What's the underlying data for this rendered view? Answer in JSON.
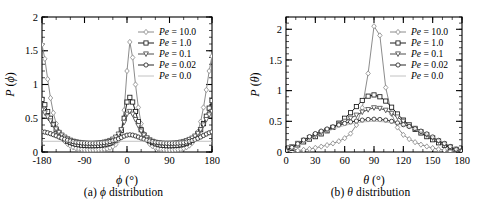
{
  "figure": {
    "panels": [
      {
        "id": "a",
        "caption_prefix": "(a)",
        "caption_symbol": "ϕ",
        "caption_text": "distribution",
        "axis_label_x_symbol": "ϕ",
        "axis_label_x_unit": "(°)",
        "axis_label_y": "P (ϕ)"
      },
      {
        "id": "b",
        "caption_prefix": "(b)",
        "caption_symbol": "θ",
        "caption_text": "distribution",
        "axis_label_x_symbol": "θ",
        "axis_label_x_unit": "(°)",
        "axis_label_y": "P (θ)"
      }
    ]
  },
  "chart_data": [
    {
      "type": "line",
      "panel": "a",
      "title": "(a) ϕ distribution",
      "xlabel": "ϕ (°)",
      "ylabel": "P (ϕ)",
      "xlim": [
        -180,
        180
      ],
      "ylim": [
        0,
        2
      ],
      "xticks": [
        -180,
        -90,
        0,
        90,
        180
      ],
      "xtick_labels": [
        "-180",
        "-90",
        "0",
        "90",
        "180"
      ],
      "yticks": [
        0,
        0.5,
        1,
        1.5,
        2
      ],
      "ytick_labels": [
        "0",
        "0.5",
        "1",
        "1.5",
        "2"
      ],
      "xminor_step": 30,
      "yminor_step": 0.1,
      "grid": false,
      "legend_position": "upper-right",
      "series": [
        {
          "name": "Pe = 10.0",
          "marker": "diamond",
          "color": "#8c8c8c",
          "x": [
            -180,
            -174,
            -168,
            -162,
            -156,
            -150,
            -144,
            -138,
            -132,
            -126,
            -120,
            -114,
            -108,
            -102,
            -96,
            -90,
            -84,
            -78,
            -72,
            -66,
            -60,
            -54,
            -48,
            -42,
            -36,
            -30,
            -24,
            -18,
            -12,
            -6,
            0,
            6,
            12,
            18,
            24,
            30,
            36,
            42,
            48,
            54,
            60,
            66,
            72,
            78,
            84,
            90,
            96,
            102,
            108,
            114,
            120,
            126,
            132,
            138,
            144,
            150,
            156,
            162,
            168,
            174,
            180
          ],
          "y": [
            1.59,
            1.38,
            1.08,
            0.8,
            0.58,
            0.42,
            0.3,
            0.22,
            0.16,
            0.12,
            0.09,
            0.07,
            0.055,
            0.045,
            0.04,
            0.035,
            0.033,
            0.032,
            0.032,
            0.033,
            0.035,
            0.038,
            0.042,
            0.05,
            0.062,
            0.08,
            0.11,
            0.17,
            0.3,
            0.62,
            1.2,
            1.63,
            1.4,
            1.0,
            0.66,
            0.42,
            0.27,
            0.18,
            0.12,
            0.085,
            0.062,
            0.05,
            0.042,
            0.036,
            0.033,
            0.032,
            0.032,
            0.033,
            0.036,
            0.042,
            0.052,
            0.07,
            0.095,
            0.135,
            0.2,
            0.3,
            0.45,
            0.66,
            0.92,
            1.2,
            1.42
          ]
        },
        {
          "name": "Pe = 1.0",
          "marker": "square",
          "color": "#1a1a1a",
          "x": [
            -180,
            -174,
            -168,
            -162,
            -156,
            -150,
            -144,
            -138,
            -132,
            -126,
            -120,
            -114,
            -108,
            -102,
            -96,
            -90,
            -84,
            -78,
            -72,
            -66,
            -60,
            -54,
            -48,
            -42,
            -36,
            -30,
            -24,
            -18,
            -12,
            -6,
            0,
            6,
            12,
            18,
            24,
            30,
            36,
            42,
            48,
            54,
            60,
            66,
            72,
            78,
            84,
            90,
            96,
            102,
            108,
            114,
            120,
            126,
            132,
            138,
            144,
            150,
            156,
            162,
            168,
            174,
            180
          ],
          "y": [
            0.78,
            0.7,
            0.6,
            0.5,
            0.41,
            0.33,
            0.27,
            0.22,
            0.185,
            0.16,
            0.14,
            0.125,
            0.115,
            0.108,
            0.102,
            0.098,
            0.095,
            0.094,
            0.094,
            0.095,
            0.098,
            0.102,
            0.108,
            0.118,
            0.13,
            0.15,
            0.18,
            0.23,
            0.32,
            0.5,
            0.74,
            0.81,
            0.74,
            0.6,
            0.45,
            0.33,
            0.25,
            0.2,
            0.165,
            0.14,
            0.122,
            0.11,
            0.102,
            0.097,
            0.094,
            0.093,
            0.094,
            0.096,
            0.1,
            0.107,
            0.117,
            0.13,
            0.15,
            0.175,
            0.21,
            0.26,
            0.33,
            0.42,
            0.53,
            0.65,
            0.76
          ]
        },
        {
          "name": "Pe = 0.1",
          "marker": "triangle-down",
          "color": "#4d4d4d",
          "x": [
            -180,
            -174,
            -168,
            -162,
            -156,
            -150,
            -144,
            -138,
            -132,
            -126,
            -120,
            -114,
            -108,
            -102,
            -96,
            -90,
            -84,
            -78,
            -72,
            -66,
            -60,
            -54,
            -48,
            -42,
            -36,
            -30,
            -24,
            -18,
            -12,
            -6,
            0,
            6,
            12,
            18,
            24,
            30,
            36,
            42,
            48,
            54,
            60,
            66,
            72,
            78,
            84,
            90,
            96,
            102,
            108,
            114,
            120,
            126,
            132,
            138,
            144,
            150,
            156,
            162,
            168,
            174,
            180
          ],
          "y": [
            0.62,
            0.58,
            0.52,
            0.46,
            0.4,
            0.34,
            0.29,
            0.25,
            0.22,
            0.195,
            0.175,
            0.16,
            0.15,
            0.142,
            0.136,
            0.132,
            0.13,
            0.129,
            0.129,
            0.131,
            0.134,
            0.139,
            0.146,
            0.156,
            0.17,
            0.19,
            0.22,
            0.265,
            0.33,
            0.44,
            0.56,
            0.6,
            0.56,
            0.48,
            0.39,
            0.31,
            0.25,
            0.21,
            0.18,
            0.158,
            0.144,
            0.135,
            0.13,
            0.128,
            0.128,
            0.129,
            0.131,
            0.134,
            0.139,
            0.146,
            0.155,
            0.168,
            0.185,
            0.205,
            0.235,
            0.275,
            0.33,
            0.4,
            0.48,
            0.55,
            0.6
          ]
        },
        {
          "name": "Pe = 0.02",
          "marker": "circle",
          "color": "#262626",
          "x": [
            -180,
            -174,
            -168,
            -162,
            -156,
            -150,
            -144,
            -138,
            -132,
            -126,
            -120,
            -114,
            -108,
            -102,
            -96,
            -90,
            -84,
            -78,
            -72,
            -66,
            -60,
            -54,
            -48,
            -42,
            -36,
            -30,
            -24,
            -18,
            -12,
            -6,
            0,
            6,
            12,
            18,
            24,
            30,
            36,
            42,
            48,
            54,
            60,
            66,
            72,
            78,
            84,
            90,
            96,
            102,
            108,
            114,
            120,
            126,
            132,
            138,
            144,
            150,
            156,
            162,
            168,
            174,
            180
          ],
          "y": [
            0.3,
            0.295,
            0.285,
            0.272,
            0.256,
            0.24,
            0.222,
            0.205,
            0.19,
            0.176,
            0.164,
            0.154,
            0.146,
            0.14,
            0.135,
            0.131,
            0.129,
            0.128,
            0.128,
            0.129,
            0.131,
            0.135,
            0.14,
            0.147,
            0.156,
            0.167,
            0.18,
            0.196,
            0.215,
            0.235,
            0.25,
            0.255,
            0.25,
            0.238,
            0.222,
            0.205,
            0.19,
            0.176,
            0.164,
            0.154,
            0.146,
            0.14,
            0.135,
            0.131,
            0.129,
            0.128,
            0.128,
            0.129,
            0.131,
            0.135,
            0.14,
            0.148,
            0.158,
            0.17,
            0.185,
            0.202,
            0.222,
            0.245,
            0.266,
            0.285,
            0.298
          ]
        },
        {
          "name": "Pe = 0.0",
          "marker": "none",
          "color": "#b3b3b3",
          "x": [
            -180,
            180
          ],
          "y": [
            0.159,
            0.159
          ]
        }
      ]
    },
    {
      "type": "line",
      "panel": "b",
      "title": "(b) θ distribution",
      "xlabel": "θ (°)",
      "ylabel": "P (θ)",
      "xlim": [
        0,
        180
      ],
      "ylim": [
        0,
        2.2
      ],
      "xticks": [
        0,
        30,
        60,
        90,
        120,
        150,
        180
      ],
      "xtick_labels": [
        "0",
        "30",
        "60",
        "90",
        "120",
        "150",
        "180"
      ],
      "yticks": [
        0,
        0.5,
        1,
        1.5,
        2
      ],
      "ytick_labels": [
        "0",
        "0.5",
        "1",
        "1.5",
        "2"
      ],
      "xminor_step": 10,
      "yminor_step": 0.1,
      "grid": false,
      "legend_position": "upper-right",
      "series": [
        {
          "name": "Pe = 10.0",
          "marker": "diamond",
          "color": "#8c8c8c",
          "x": [
            0,
            6,
            12,
            18,
            24,
            30,
            36,
            42,
            48,
            54,
            60,
            66,
            72,
            78,
            84,
            90,
            96,
            102,
            108,
            114,
            120,
            126,
            132,
            138,
            144,
            150,
            156,
            162,
            168,
            174,
            180
          ],
          "y": [
            0.005,
            0.012,
            0.022,
            0.035,
            0.05,
            0.068,
            0.088,
            0.112,
            0.14,
            0.175,
            0.225,
            0.3,
            0.44,
            0.72,
            1.28,
            2.05,
            1.9,
            1.05,
            0.62,
            0.4,
            0.28,
            0.21,
            0.16,
            0.12,
            0.09,
            0.065,
            0.045,
            0.03,
            0.018,
            0.008,
            0.003
          ]
        },
        {
          "name": "Pe = 1.0",
          "marker": "square",
          "color": "#1a1a1a",
          "x": [
            0,
            6,
            12,
            18,
            24,
            30,
            36,
            42,
            48,
            54,
            60,
            66,
            72,
            78,
            84,
            90,
            96,
            102,
            108,
            114,
            120,
            126,
            132,
            138,
            144,
            150,
            156,
            162,
            168,
            174,
            180
          ],
          "y": [
            0.012,
            0.06,
            0.115,
            0.165,
            0.21,
            0.25,
            0.295,
            0.345,
            0.4,
            0.47,
            0.55,
            0.64,
            0.74,
            0.84,
            0.91,
            0.93,
            0.9,
            0.83,
            0.73,
            0.62,
            0.52,
            0.44,
            0.37,
            0.31,
            0.25,
            0.2,
            0.15,
            0.11,
            0.07,
            0.035,
            0.01
          ]
        },
        {
          "name": "Pe = 0.1",
          "marker": "triangle-down",
          "color": "#4d4d4d",
          "x": [
            0,
            6,
            12,
            18,
            24,
            30,
            36,
            42,
            48,
            54,
            60,
            66,
            72,
            78,
            84,
            90,
            96,
            102,
            108,
            114,
            120,
            126,
            132,
            138,
            144,
            150,
            156,
            162,
            168,
            174,
            180
          ],
          "y": [
            0.03,
            0.085,
            0.14,
            0.19,
            0.235,
            0.275,
            0.315,
            0.355,
            0.4,
            0.45,
            0.5,
            0.55,
            0.6,
            0.65,
            0.69,
            0.72,
            0.71,
            0.68,
            0.63,
            0.57,
            0.5,
            0.44,
            0.385,
            0.33,
            0.28,
            0.23,
            0.18,
            0.13,
            0.085,
            0.045,
            0.015
          ]
        },
        {
          "name": "Pe = 0.02",
          "marker": "circle",
          "color": "#262626",
          "x": [
            0,
            6,
            12,
            18,
            24,
            30,
            36,
            42,
            48,
            54,
            60,
            66,
            72,
            78,
            84,
            90,
            96,
            102,
            108,
            114,
            120,
            126,
            132,
            138,
            144,
            150,
            156,
            162,
            168,
            174,
            180
          ],
          "y": [
            0.02,
            0.075,
            0.135,
            0.195,
            0.25,
            0.3,
            0.34,
            0.375,
            0.41,
            0.44,
            0.465,
            0.49,
            0.505,
            0.52,
            0.53,
            0.535,
            0.53,
            0.52,
            0.5,
            0.475,
            0.445,
            0.415,
            0.38,
            0.34,
            0.295,
            0.245,
            0.19,
            0.14,
            0.09,
            0.045,
            0.015
          ]
        },
        {
          "name": "Pe = 0.0",
          "marker": "none",
          "color": "#b3b3b3",
          "x": [
            0,
            10,
            20,
            30,
            40,
            50,
            60,
            70,
            80,
            90,
            100,
            110,
            120,
            130,
            140,
            150,
            160,
            170,
            180
          ],
          "y": [
            0.0,
            0.087,
            0.171,
            0.25,
            0.321,
            0.383,
            0.433,
            0.47,
            0.492,
            0.5,
            0.492,
            0.47,
            0.433,
            0.383,
            0.321,
            0.25,
            0.171,
            0.087,
            0.0
          ]
        }
      ]
    }
  ],
  "legend": {
    "entries": [
      {
        "label": "Pe = 10.0",
        "prefix": "Pe",
        "value": "= 10.0",
        "marker": "diamond"
      },
      {
        "label": "Pe = 1.0",
        "prefix": "Pe",
        "value": "= 1.0",
        "marker": "square"
      },
      {
        "label": "Pe = 0.1",
        "prefix": "Pe",
        "value": "= 0.1",
        "marker": "triangle-down"
      },
      {
        "label": "Pe = 0.02",
        "prefix": "Pe",
        "value": "= 0.02",
        "marker": "circle"
      },
      {
        "label": "Pe = 0.0",
        "prefix": "Pe",
        "value": "= 0.0",
        "marker": "none"
      }
    ]
  }
}
